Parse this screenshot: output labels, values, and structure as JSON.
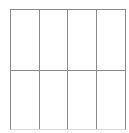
{
  "figure": {
    "kind": "blank-grid",
    "canvas": {
      "width": 129,
      "height": 133,
      "background": "#ffffff"
    },
    "frame": {
      "x": 10,
      "y": 9,
      "width": 116,
      "height": 121
    },
    "stroke": {
      "color": "#8a8a8a",
      "bottom_edge_color": "#d9d9d9",
      "width_px": 1
    },
    "columns": 4,
    "rows": 2,
    "vertical_rule_x": [
      10,
      39,
      68,
      97,
      126
    ],
    "horizontal_rule_y": [
      9,
      71,
      130
    ],
    "row_heights_px": [
      62,
      59
    ],
    "column_width_px": 29
  },
  "table": {
    "caption": "",
    "headers": [
      "",
      "",
      "",
      ""
    ],
    "cells": [
      [
        "",
        "",
        "",
        ""
      ],
      [
        "",
        "",
        "",
        ""
      ]
    ]
  }
}
